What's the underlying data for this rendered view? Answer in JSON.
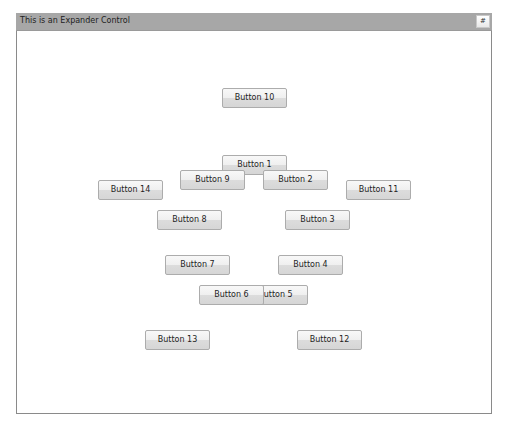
{
  "expander": {
    "title": "This is an Expander Control",
    "toggle_label": "#"
  },
  "buttons": [
    {
      "id": 10,
      "label": "Button 10",
      "x": 222,
      "y": 88
    },
    {
      "id": 1,
      "label": "Button 1",
      "x": 222,
      "y": 155
    },
    {
      "id": 9,
      "label": "Button 9",
      "x": 180,
      "y": 170
    },
    {
      "id": 2,
      "label": "Button 2",
      "x": 263,
      "y": 170
    },
    {
      "id": 14,
      "label": "Button 14",
      "x": 98,
      "y": 180
    },
    {
      "id": 11,
      "label": "Button 11",
      "x": 346,
      "y": 180
    },
    {
      "id": 8,
      "label": "Button 8",
      "x": 157,
      "y": 210
    },
    {
      "id": 3,
      "label": "Button 3",
      "x": 285,
      "y": 210
    },
    {
      "id": 7,
      "label": "Button 7",
      "x": 165,
      "y": 255
    },
    {
      "id": 4,
      "label": "Button 4",
      "x": 278,
      "y": 255
    },
    {
      "id": 5,
      "label": "Button 5",
      "x": 243,
      "y": 285
    },
    {
      "id": 6,
      "label": "Button 6",
      "x": 199,
      "y": 285
    },
    {
      "id": 13,
      "label": "Button 13",
      "x": 145,
      "y": 330
    },
    {
      "id": 12,
      "label": "Button 12",
      "x": 297,
      "y": 330
    }
  ]
}
